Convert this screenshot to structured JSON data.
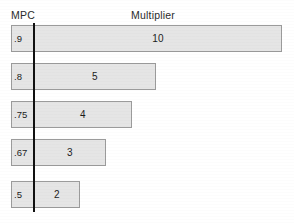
{
  "page": {
    "background_color": "#ffffff",
    "width": 294,
    "height": 223,
    "cropped_caption_sliver": ""
  },
  "headers": {
    "mpc": "MPC",
    "multiplier": "Multiplier"
  },
  "style": {
    "bar_fill": "#e5e5e5",
    "bar_border": "#9b9b9b",
    "axis_line_color": "#111111",
    "text_color": "#1c1c1c"
  },
  "chart_data": {
    "type": "bar",
    "title": "",
    "xlabel": "Multiplier",
    "ylabel": "MPC",
    "orientation": "horizontal",
    "grid": false,
    "legend": "none",
    "categories": [
      ".9",
      ".8",
      ".75",
      ".67",
      ".5"
    ],
    "values": [
      10,
      5,
      4,
      3,
      2
    ],
    "value_labels": [
      "10",
      "5",
      "4",
      "3",
      "2"
    ],
    "category_labels": [
      ".9",
      ".8",
      ".75",
      ".67",
      ".5"
    ],
    "bar_pixel_widths": [
      271,
      145,
      121,
      95,
      69
    ],
    "rows": [
      {
        "mpc": ".9",
        "multiplier": "10",
        "value": 10,
        "bar_width_px": 271,
        "top_px": 25
      },
      {
        "mpc": ".8",
        "multiplier": "5",
        "value": 5,
        "bar_width_px": 145,
        "top_px": 63
      },
      {
        "mpc": ".75",
        "multiplier": "4",
        "value": 4,
        "bar_width_px": 121,
        "top_px": 101
      },
      {
        "mpc": ".67",
        "multiplier": "3",
        "value": 3,
        "bar_width_px": 95,
        "top_px": 139
      },
      {
        "mpc": ".5",
        "multiplier": "2",
        "value": 2,
        "bar_width_px": 69,
        "top_px": 181
      }
    ]
  }
}
